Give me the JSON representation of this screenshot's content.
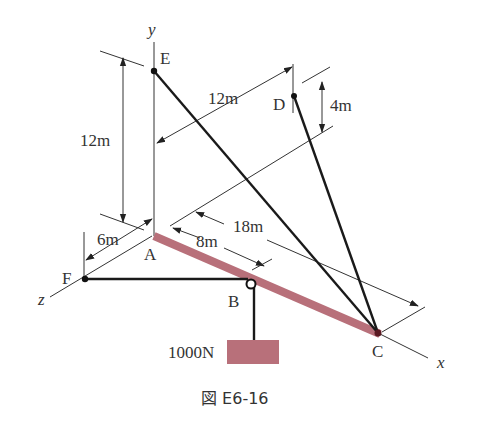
{
  "figure": {
    "caption": "図 E6-16",
    "axes": {
      "x": "x",
      "y": "y",
      "z": "z"
    },
    "points": {
      "A": "A",
      "B": "B",
      "C": "C",
      "D": "D",
      "E": "E",
      "F": "F"
    },
    "dimensions": {
      "height_E": "12m",
      "width_ED": "12m",
      "height_D": "4m",
      "z_AF": "6m",
      "x_AB": "8m",
      "x_AC": "18m"
    },
    "load": "1000N",
    "colors": {
      "beam": "#b8707a",
      "weight": "#b8707a",
      "line": "#333333"
    }
  }
}
